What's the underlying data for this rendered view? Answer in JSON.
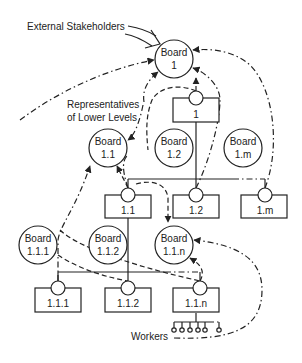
{
  "diagram": {
    "labels": {
      "external": "External Stakeholders",
      "representatives_line1": "Representatives",
      "representatives_line2": "of Lower Levels",
      "workers": "Workers"
    },
    "boards": [
      {
        "id": "b1",
        "line1": "Board",
        "line2": "1"
      },
      {
        "id": "b11",
        "line1": "Board",
        "line2": "1.1"
      },
      {
        "id": "b12",
        "line1": "Board",
        "line2": "1.2"
      },
      {
        "id": "b1m",
        "line1": "Board",
        "line2": "1.m"
      },
      {
        "id": "b111",
        "line1": "Board",
        "line2": "1.1.1"
      },
      {
        "id": "b112",
        "line1": "Board",
        "line2": "1.1.2"
      },
      {
        "id": "b11n",
        "line1": "Board",
        "line2": "1.1.n"
      }
    ],
    "units": [
      {
        "id": "u1",
        "label": "1"
      },
      {
        "id": "u11",
        "label": "1.1"
      },
      {
        "id": "u12",
        "label": "1.2"
      },
      {
        "id": "u1m",
        "label": "1.m"
      },
      {
        "id": "u111",
        "label": "1.1.1"
      },
      {
        "id": "u112",
        "label": "1.1.2"
      },
      {
        "id": "u11n",
        "label": "1.1.n"
      }
    ]
  }
}
